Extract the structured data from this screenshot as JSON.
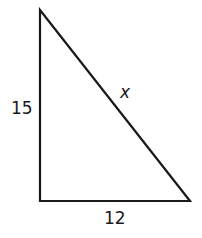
{
  "diagram": {
    "type": "right-triangle",
    "stroke_color": "#1a1a1a",
    "labels": {
      "left_side": "15",
      "bottom_side": "12",
      "hypotenuse": "x"
    }
  }
}
